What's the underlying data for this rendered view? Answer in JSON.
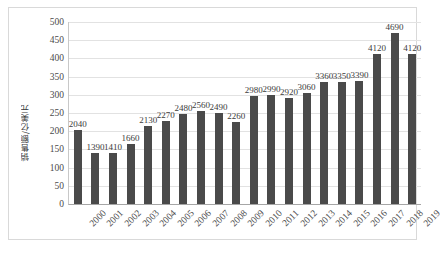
{
  "chart_data": {
    "type": "bar",
    "title": "",
    "xlabel": "",
    "ylabel": "销售额/亿美元",
    "ylim": [
      0,
      500
    ],
    "ytick_step": 50,
    "grid": true,
    "legend": "none",
    "value_label_scale_note": "bar value labels are raw sales figures; axis is in 亿美元 hundreds",
    "categories": [
      "2000",
      "2001",
      "2002",
      "2003",
      "2004",
      "2005",
      "2006",
      "2007",
      "2008",
      "2009",
      "2010",
      "2011",
      "2012",
      "2013",
      "2014",
      "2015",
      "2016",
      "2017",
      "2018",
      "2019"
    ],
    "values": [
      2040,
      1390,
      1410,
      1660,
      2130,
      2270,
      2480,
      2560,
      2490,
      2260,
      2980,
      2990,
      2920,
      3060,
      3360,
      3350,
      3390,
      4120,
      4690,
      4120
    ],
    "yticks": [
      "500",
      "450",
      "400",
      "350",
      "300",
      "250",
      "200",
      "150",
      "100",
      "50",
      "0"
    ],
    "ytick_values": [
      500,
      450,
      400,
      350,
      300,
      250,
      200,
      150,
      100,
      50,
      0
    ],
    "bar_color": "#4a4a4a",
    "gridline_color": "#e2e2e2",
    "axis_color": "#a6a6a6",
    "background_color": "#ffffff",
    "label_color": "#3c3c3c"
  }
}
